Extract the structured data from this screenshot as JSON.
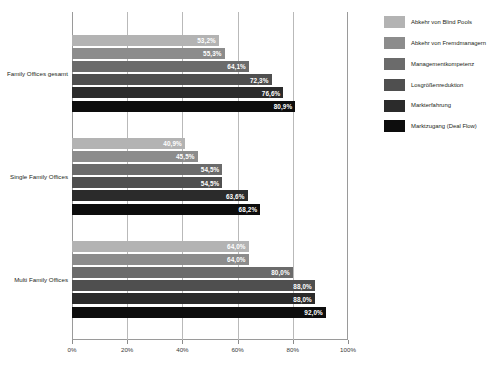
{
  "chart_data": {
    "type": "bar",
    "orientation": "horizontal",
    "title": "",
    "xlabel": "",
    "ylabel": "",
    "xlim": [
      0,
      100
    ],
    "xticks": [
      "0%",
      "20%",
      "40%",
      "60%",
      "80%",
      "100%"
    ],
    "xtick_values": [
      0,
      20,
      40,
      60,
      80,
      100
    ],
    "grid": true,
    "legend_position": "right",
    "categories": [
      "Family Offices gesamt",
      "Single Family Offices",
      "Multi Family Offices"
    ],
    "series": [
      {
        "name": "Abkehr von Blind Pools",
        "color": "#b3b3b3",
        "values": [
          53.2,
          40.9,
          64.0
        ],
        "labels": [
          "53,2%",
          "40,9%",
          "64,0%"
        ]
      },
      {
        "name": "Abkehr von Fremdmanagern",
        "color": "#8c8c8c",
        "values": [
          55.3,
          45.5,
          64.0
        ],
        "labels": [
          "55,3%",
          "45,5%",
          "64,0%"
        ]
      },
      {
        "name": "Managementkompetenz",
        "color": "#6b6b6b",
        "values": [
          64.1,
          54.5,
          80.0
        ],
        "labels": [
          "64,1%",
          "54,5%",
          "80,0%"
        ]
      },
      {
        "name": "Losgrößenreduktion",
        "color": "#4f4f4f",
        "values": [
          72.3,
          54.5,
          88.0
        ],
        "labels": [
          "72,3%",
          "54,5%",
          "88,0%"
        ]
      },
      {
        "name": "Markterfahrung",
        "color": "#2b2b2b",
        "values": [
          76.6,
          63.6,
          88.0
        ],
        "labels": [
          "76,6%",
          "63,6%",
          "88,0%"
        ]
      },
      {
        "name": "Marktzugang (Deal Flow)",
        "color": "#0d0d0d",
        "values": [
          80.9,
          68.2,
          92.0
        ],
        "labels": [
          "80,9%",
          "68,2%",
          "92,0%"
        ]
      }
    ]
  },
  "legend": {
    "items": [
      "Abkehr von Blind Pools",
      "Abkehr von Fremdmanagern",
      "Managementkompetenz",
      "Losgrößenreduktion",
      "Markterfahrung",
      "Marktzugang (Deal Flow)"
    ]
  },
  "axis": {
    "xticks": [
      "0%",
      "20%",
      "40%",
      "60%",
      "80%",
      "100%"
    ]
  },
  "caption": {
    "text": ""
  }
}
